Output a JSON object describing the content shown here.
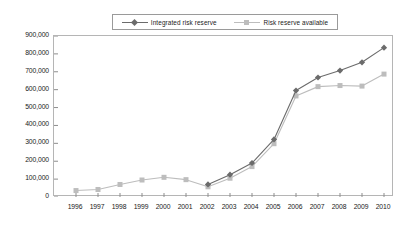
{
  "chart_data": {
    "type": "line",
    "title": "",
    "xlabel": "",
    "ylabel": "",
    "x": [
      1996,
      1997,
      1998,
      1999,
      2000,
      2001,
      2002,
      2003,
      2004,
      2005,
      2006,
      2007,
      2008,
      2009,
      2010
    ],
    "categories": [
      "1996",
      "1997",
      "1998",
      "1999",
      "2000",
      "2001",
      "2002",
      "2003",
      "2004",
      "2005",
      "2006",
      "2007",
      "2008",
      "2009",
      "2010"
    ],
    "ylim": [
      0,
      900000
    ],
    "ytick_values": [
      0,
      100000,
      200000,
      300000,
      400000,
      500000,
      600000,
      700000,
      800000,
      900000
    ],
    "ytick_labels": [
      "0",
      "100,000",
      "200,000",
      "300,000",
      "400,000",
      "500,000",
      "600,000",
      "700,000",
      "800,000",
      "900,000"
    ],
    "grid": false,
    "legend_position": "top-center",
    "series": [
      {
        "name": "Integrated risk reserve",
        "color": "#6b6b6b",
        "marker": "diamond",
        "x": [
          2002,
          2003,
          2004,
          2005,
          2006,
          2007,
          2008,
          2009,
          2010
        ],
        "values": [
          70000,
          125000,
          190000,
          322000,
          595000,
          668000,
          707000,
          753000,
          835000
        ]
      },
      {
        "name": "Risk reserve available",
        "color": "#bdbdbd",
        "marker": "square",
        "x": [
          1996,
          1997,
          1998,
          1999,
          2000,
          2001,
          2002,
          2003,
          2004,
          2005,
          2006,
          2007,
          2008,
          2009,
          2010
        ],
        "values": [
          36000,
          42000,
          70000,
          95000,
          110000,
          97000,
          57000,
          105000,
          170000,
          298000,
          565000,
          617000,
          623000,
          620000,
          687000
        ]
      }
    ]
  },
  "legend": {
    "entries": [
      {
        "label": "Integrated risk reserve",
        "color": "#6b6b6b",
        "marker": "diamond"
      },
      {
        "label": "Risk reserve available",
        "color": "#bdbdbd",
        "marker": "square"
      }
    ]
  },
  "colors": {
    "series_dark": "#6b6b6b",
    "series_light": "#bdbdbd",
    "axis": "#b5b5b5",
    "tick": "#8d8d8d",
    "text": "#1a1a1a",
    "background": "#ffffff"
  }
}
